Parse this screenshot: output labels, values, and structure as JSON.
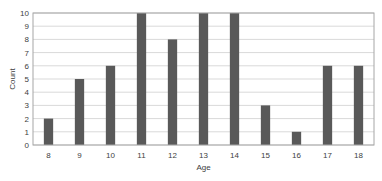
{
  "chart_data": {
    "type": "bar",
    "title": "",
    "xlabel": "Age",
    "ylabel": "Count",
    "categories": [
      "8",
      "9",
      "10",
      "11",
      "12",
      "13",
      "14",
      "15",
      "16",
      "17",
      "18"
    ],
    "values": [
      2,
      5,
      6,
      10,
      8,
      10,
      10,
      3,
      1,
      6,
      6
    ],
    "ylim": [
      0,
      10
    ],
    "yticks": [
      "0",
      "1",
      "2",
      "3",
      "4",
      "5",
      "6",
      "7",
      "8",
      "9",
      "10"
    ],
    "grid": true,
    "legend": "none",
    "colors": {
      "bar": "#595959",
      "grid": "#d9d9d9",
      "frame": "#a6a6a6",
      "text": "#404040"
    }
  }
}
